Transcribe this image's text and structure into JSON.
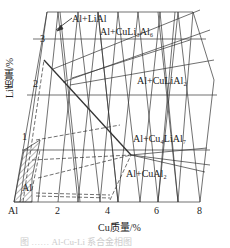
{
  "diagram": {
    "type": "Al-Cu-Li ternary phase region diagram (Al-rich corner)",
    "x_axis_label": "Cu质量/%",
    "y_axis_label": "Li质量/%",
    "x_ticks": [
      "Al",
      "2",
      "4",
      "6",
      "8"
    ],
    "y_ticks": [
      "1",
      "2",
      "3"
    ],
    "regions": [
      {
        "label": "Al+LiAl"
      },
      {
        "label": "Al+CuLi₃Al₆"
      },
      {
        "label": "Al+CuLiAl₂"
      },
      {
        "label": "Al+Cu₄LiAl₇"
      },
      {
        "label": "Al+CuAl₂"
      },
      {
        "label": "Al"
      }
    ],
    "caption": "图 …… Al-Cu-Li 系合金相图"
  }
}
